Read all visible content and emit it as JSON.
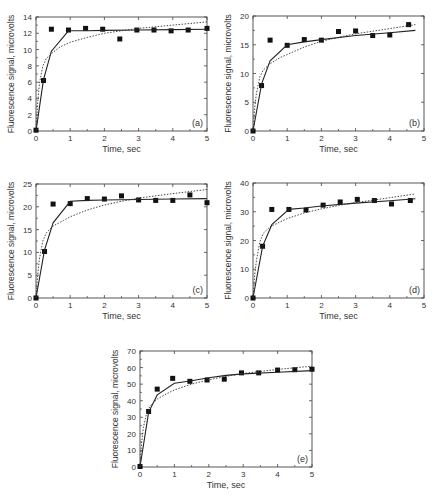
{
  "chart_data": [
    {
      "id": "a",
      "type": "scatter",
      "panel_label": "(a)",
      "xlabel": "Time, sec",
      "ylabel": "Fluorescence signal, microvolts",
      "xlim": [
        0,
        5
      ],
      "ylim": [
        0,
        14
      ],
      "xticks": [
        0,
        1,
        2,
        3,
        4,
        5
      ],
      "yticks": [
        0,
        2,
        4,
        6,
        8,
        10,
        12,
        14
      ],
      "grid": false,
      "legend": null,
      "series": [
        {
          "name": "data",
          "style": "square-marker",
          "x": [
            0,
            0.22,
            0.45,
            0.95,
            1.45,
            1.95,
            2.45,
            2.95,
            3.45,
            3.95,
            4.45,
            5.0
          ],
          "y": [
            0.1,
            6.2,
            12.5,
            12.4,
            12.6,
            12.5,
            11.3,
            12.4,
            12.4,
            12.3,
            12.4,
            12.6
          ]
        },
        {
          "name": "solid fit",
          "style": "solid-line",
          "x": [
            0,
            0.22,
            0.45,
            0.95,
            1.5,
            2,
            3,
            4,
            5
          ],
          "y": [
            0,
            6.3,
            9.8,
            12.3,
            12.3,
            12.35,
            12.4,
            12.45,
            12.5
          ]
        },
        {
          "name": "dotted fit",
          "style": "dotted-line",
          "x": [
            0,
            0.05,
            0.1,
            0.2,
            0.3,
            0.45,
            0.7,
            1.0,
            1.5,
            2.0,
            2.5,
            3.0,
            4.0,
            5.0
          ],
          "y": [
            0,
            3.5,
            5.8,
            8.0,
            8.9,
            9.5,
            10.3,
            10.9,
            11.5,
            12.0,
            12.3,
            12.6,
            13.0,
            13.4
          ]
        }
      ]
    },
    {
      "id": "b",
      "type": "scatter",
      "panel_label": "(b)",
      "xlabel": "Time, sec",
      "ylabel": "Fluorescence signal, microvolts",
      "xlim": [
        0,
        5
      ],
      "ylim": [
        0,
        20
      ],
      "xticks": [
        0,
        1,
        2,
        3,
        4,
        5
      ],
      "yticks": [
        0,
        5,
        10,
        15,
        20
      ],
      "grid": false,
      "legend": null,
      "series": [
        {
          "name": "data",
          "style": "square-marker",
          "x": [
            0,
            0.25,
            0.5,
            1.0,
            1.5,
            2.0,
            2.5,
            3.0,
            3.5,
            4.0,
            4.55
          ],
          "y": [
            0,
            7.9,
            15.8,
            14.9,
            15.9,
            15.8,
            17.3,
            17.4,
            16.6,
            16.7,
            18.5
          ]
        },
        {
          "name": "solid fit",
          "style": "solid-line",
          "x": [
            0,
            0.25,
            0.5,
            1.0,
            1.5,
            2.0,
            3.0,
            4.0,
            4.75
          ],
          "y": [
            0,
            8.2,
            12.2,
            15.0,
            15.5,
            15.9,
            16.6,
            17.1,
            17.5
          ]
        },
        {
          "name": "dotted fit",
          "style": "dotted-line",
          "x": [
            0,
            0.05,
            0.1,
            0.2,
            0.3,
            0.5,
            0.8,
            1.0,
            1.5,
            2.0,
            2.5,
            3.0,
            4.0,
            4.75
          ],
          "y": [
            0,
            4.0,
            6.5,
            9.4,
            10.6,
            11.7,
            12.8,
            13.3,
            14.6,
            15.6,
            16.3,
            16.9,
            17.8,
            18.5
          ]
        }
      ]
    },
    {
      "id": "c",
      "type": "scatter",
      "panel_label": "(c)",
      "xlabel": "Time, sec",
      "ylabel": "Fluorescence signal, microvolts",
      "xlim": [
        0,
        5
      ],
      "ylim": [
        0,
        25
      ],
      "xticks": [
        0,
        1,
        2,
        3,
        4,
        5
      ],
      "yticks": [
        0,
        5,
        10,
        15,
        20,
        25
      ],
      "grid": false,
      "legend": null,
      "series": [
        {
          "name": "data",
          "style": "square-marker",
          "x": [
            0,
            0.25,
            0.5,
            1.0,
            1.5,
            2.0,
            2.5,
            3.0,
            3.5,
            4.0,
            4.5,
            5.0
          ],
          "y": [
            0,
            10.2,
            20.6,
            20.7,
            21.8,
            21.7,
            22.4,
            21.5,
            21.4,
            21.4,
            22.6,
            20.9
          ]
        },
        {
          "name": "solid fit",
          "style": "solid-line",
          "x": [
            0,
            0.25,
            0.5,
            1.0,
            1.5,
            2.0,
            3.0,
            4.0,
            5.0
          ],
          "y": [
            0,
            10.5,
            16.5,
            21.2,
            21.4,
            21.5,
            21.6,
            21.7,
            21.8
          ]
        },
        {
          "name": "dotted fit",
          "style": "dotted-line",
          "x": [
            0,
            0.05,
            0.1,
            0.2,
            0.3,
            0.5,
            0.8,
            1.0,
            1.5,
            2.0,
            2.5,
            3.0,
            4.0,
            5.0
          ],
          "y": [
            0,
            5.0,
            8.5,
            12.5,
            14.3,
            15.8,
            17.0,
            17.8,
            19.3,
            20.4,
            21.2,
            21.9,
            22.9,
            23.8
          ]
        }
      ]
    },
    {
      "id": "d",
      "type": "scatter",
      "panel_label": "(d)",
      "xlabel": "Time, sec",
      "ylabel": "Fluorescence signal, microvolts",
      "xlim": [
        0,
        5
      ],
      "ylim": [
        0,
        40
      ],
      "xticks": [
        0,
        1,
        2,
        3,
        4,
        5
      ],
      "yticks": [
        0,
        10,
        20,
        30,
        40
      ],
      "grid": false,
      "legend": null,
      "series": [
        {
          "name": "data",
          "style": "square-marker",
          "x": [
            0,
            0.28,
            0.55,
            1.05,
            1.55,
            2.05,
            2.55,
            3.05,
            3.55,
            4.05,
            4.6
          ],
          "y": [
            0,
            18.0,
            30.8,
            30.8,
            30.6,
            32.3,
            33.4,
            34.3,
            33.9,
            32.7,
            33.9
          ]
        },
        {
          "name": "solid fit",
          "style": "solid-line",
          "x": [
            0,
            0.28,
            0.55,
            1.05,
            1.5,
            2.0,
            3.0,
            4.0,
            4.75
          ],
          "y": [
            0,
            18.0,
            25.5,
            30.8,
            31.3,
            32.0,
            33.0,
            33.8,
            34.5
          ]
        },
        {
          "name": "dotted fit",
          "style": "dotted-line",
          "x": [
            0,
            0.05,
            0.1,
            0.2,
            0.3,
            0.5,
            0.8,
            1.0,
            1.5,
            2.0,
            2.5,
            3.0,
            4.0,
            4.75
          ],
          "y": [
            0,
            8.0,
            13.0,
            19.5,
            22.5,
            24.8,
            26.5,
            27.6,
            29.6,
            31.0,
            32.2,
            33.2,
            34.9,
            36.2
          ]
        }
      ]
    },
    {
      "id": "e",
      "type": "scatter",
      "panel_label": "(e)",
      "xlabel": "Time, sec",
      "ylabel": "Fluorescence signal, microvolts",
      "xlim": [
        0,
        5
      ],
      "ylim": [
        0,
        70
      ],
      "xticks": [
        0,
        1,
        2,
        3,
        4,
        5
      ],
      "yticks": [
        0,
        10,
        20,
        30,
        40,
        50,
        60,
        70
      ],
      "grid": false,
      "legend": null,
      "series": [
        {
          "name": "data",
          "style": "square-marker",
          "x": [
            0,
            0.25,
            0.5,
            0.95,
            1.45,
            1.95,
            2.45,
            2.95,
            3.45,
            4.0,
            4.5,
            5.0
          ],
          "y": [
            0.3,
            33.5,
            47.0,
            53.5,
            51.7,
            52.5,
            53.0,
            56.8,
            56.8,
            58.5,
            58.7,
            59.0
          ]
        },
        {
          "name": "solid fit",
          "style": "solid-line",
          "x": [
            0,
            0.25,
            0.5,
            1.0,
            1.5,
            2.0,
            2.5,
            3.0,
            4.0,
            5.0
          ],
          "y": [
            0,
            33.0,
            43.5,
            50.5,
            52.0,
            53.8,
            55.3,
            56.2,
            57.2,
            58.2
          ]
        },
        {
          "name": "dotted fit",
          "style": "dotted-line",
          "x": [
            0,
            0.05,
            0.1,
            0.2,
            0.3,
            0.5,
            0.8,
            1.0,
            1.5,
            2.0,
            2.5,
            3.0,
            4.0,
            5.0
          ],
          "y": [
            0,
            15.0,
            24.0,
            33.0,
            37.0,
            41.0,
            44.5,
            46.5,
            50.0,
            52.6,
            54.7,
            56.4,
            58.9,
            60.8
          ]
        }
      ]
    }
  ],
  "layout": {
    "panels": [
      {
        "id": "a",
        "left": 36,
        "top": 17,
        "right": 207,
        "bottom": 131
      },
      {
        "id": "b",
        "left": 253,
        "top": 16,
        "right": 424,
        "bottom": 131
      },
      {
        "id": "c",
        "left": 36,
        "top": 184,
        "right": 207,
        "bottom": 298
      },
      {
        "id": "d",
        "left": 253,
        "top": 183,
        "right": 424,
        "bottom": 298
      },
      {
        "id": "e",
        "left": 140,
        "top": 351,
        "right": 312,
        "bottom": 467
      }
    ]
  },
  "colors": {
    "axis": "#444444",
    "marker": "#111111",
    "solid_line": "#222222",
    "dotted_line": "#333333",
    "text": "#333333"
  }
}
